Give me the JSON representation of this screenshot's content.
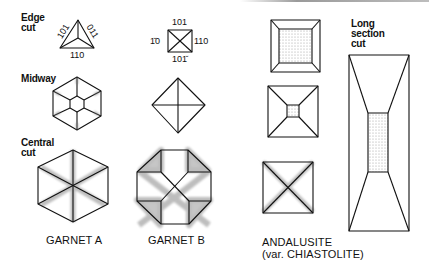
{
  "row_labels": {
    "edge_cut": "Edge\ncut",
    "midway": "Midway",
    "central_cut": "Central\ncut"
  },
  "garnet_a": {
    "caption": "GARNET A",
    "edge_indices": {
      "left": "101",
      "right": "011",
      "bottom": "110"
    }
  },
  "garnet_b": {
    "caption": "GARNET B",
    "edge_indices": {
      "top": "101",
      "left": "1̆0",
      "right": "110",
      "bottom": "101̆"
    }
  },
  "andalusite": {
    "caption_line1": "ANDALUSITE",
    "caption_line2": "(var. CHIASTOLITE)",
    "long_section_label": "Long\nsection\ncut"
  },
  "colors": {
    "line": "#111111",
    "stipple": "#8a8a8a",
    "background": "#ffffff"
  }
}
